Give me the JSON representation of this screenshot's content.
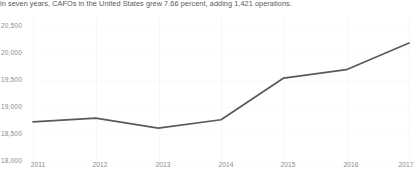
{
  "caption": {
    "text": "in seven years, CAFOs in the United States grew 7.66 percent, adding 1,421 operations."
  },
  "colors": {
    "line": "#595959",
    "gridline": "#f7f7f7",
    "axis_text": "#8c8c8c",
    "caption_text": "#585858",
    "background": "#ffffff"
  },
  "chart_data": {
    "type": "line",
    "title": "",
    "subtitle": "in seven years, CAFOs in the United States grew 7.66 percent, adding 1,421 operations.",
    "xlabel": "",
    "ylabel": "",
    "categories": [
      "2011",
      "2012",
      "2013",
      "2014",
      "2015",
      "2016",
      "2017"
    ],
    "x": [
      2011,
      2012,
      2013,
      2014,
      2015,
      2016,
      2017
    ],
    "series": [
      {
        "name": "CAFOs in the United States",
        "values": [
          18630,
          18700,
          18520,
          18670,
          19420,
          19570,
          20050
        ],
        "color": "#595959"
      }
    ],
    "ylim": [
      18000,
      20500
    ],
    "ytick_labels": [
      "20,500",
      "20,000",
      "19,500",
      "19,000",
      "18,500",
      "18,000"
    ],
    "ytick_values": [
      20500,
      20000,
      19500,
      19000,
      18500,
      18000
    ],
    "xtick_labels": [
      "2011",
      "2012",
      "2013",
      "2014",
      "2015",
      "2016",
      "2017"
    ],
    "grid": true,
    "legend": "none",
    "annotations": {
      "growth_percent": "7.66 percent",
      "added_operations": "1,421 operations",
      "period_years": "seven years"
    }
  }
}
